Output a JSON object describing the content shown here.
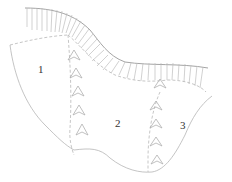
{
  "diagram": {
    "type": "landslide-zoning-sketch",
    "zones": [
      {
        "id": "1",
        "label": "1",
        "x": 38,
        "y": 73
      },
      {
        "id": "2",
        "label": "2",
        "x": 115,
        "y": 127
      },
      {
        "id": "3",
        "label": "3",
        "x": 180,
        "y": 129
      }
    ],
    "elements": {
      "scarp": "hatched-main-scarp",
      "boundaries": "dashed-zone-boundaries",
      "flow_markers": "chevron-flow-arrows"
    },
    "colors": {
      "line": "#b5b5b5",
      "scarp": "#9a9a9a",
      "label": "#333333",
      "background": "#ffffff"
    }
  }
}
